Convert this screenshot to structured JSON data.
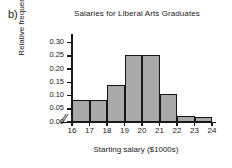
{
  "part_label": "b)",
  "axis_break_symbol": "//",
  "colors": {
    "bar_fill": "#a9a9a9",
    "bar_edge": "#151515",
    "axis": "#1a1a1a",
    "background": "#ffffff"
  },
  "chart_data": {
    "type": "bar",
    "title": "Salaries for Liberal Arts Graduates",
    "xlabel": "Starting salary ($1000s)",
    "ylabel": "Relative frequency",
    "grid": false,
    "legend": null,
    "xlim": [
      16,
      24
    ],
    "ylim": [
      0.0,
      0.325
    ],
    "x_tick_labels": [
      "16",
      "17",
      "18",
      "19",
      "20",
      "21",
      "22",
      "23",
      "24"
    ],
    "x_tick_values": [
      16,
      17,
      18,
      19,
      20,
      21,
      22,
      23,
      24
    ],
    "y_tick_labels": [
      "0.00",
      "0.05",
      "0.10",
      "0.15",
      "0.20",
      "0.25",
      "0.30"
    ],
    "y_tick_values": [
      0.0,
      0.05,
      0.1,
      0.15,
      0.2,
      0.25,
      0.3
    ],
    "bin_edges": [
      16,
      17,
      18,
      19,
      20,
      21,
      22,
      23,
      24
    ],
    "categories": [
      "16-17",
      "17-18",
      "18-19",
      "19-20",
      "20-21",
      "21-22",
      "22-23",
      "23-24"
    ],
    "values": [
      0.085,
      0.084,
      0.139,
      0.254,
      0.254,
      0.107,
      0.021,
      0.02
    ]
  }
}
